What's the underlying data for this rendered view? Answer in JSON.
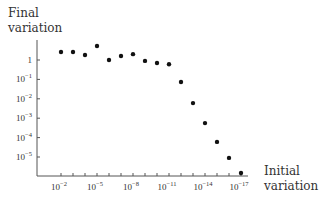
{
  "chart_data": {
    "type": "scatter",
    "title": "",
    "ylabel": "Final variation",
    "xlabel": "Initial variation",
    "y_scale": "log",
    "x_scale": "log",
    "x_reversed": true,
    "ylim": [
      1e-06,
      10
    ],
    "xlim": [
      0.1,
      1e-18
    ],
    "y_ticks": [
      {
        "exp": 0,
        "label": "1"
      },
      {
        "exp": -1,
        "label": "10",
        "sup": "−1"
      },
      {
        "exp": -2,
        "label": "10",
        "sup": "−2"
      },
      {
        "exp": -3,
        "label": "10",
        "sup": "−3"
      },
      {
        "exp": -4,
        "label": "10",
        "sup": "−4"
      },
      {
        "exp": -5,
        "label": "10",
        "sup": "−5"
      }
    ],
    "x_ticks": [
      {
        "exp": -2,
        "label": "10",
        "sup": "−2"
      },
      {
        "exp": -5,
        "label": "10",
        "sup": "−5"
      },
      {
        "exp": -8,
        "label": "10",
        "sup": "−8"
      },
      {
        "exp": -11,
        "label": "10",
        "sup": "−11"
      },
      {
        "exp": -14,
        "label": "10",
        "sup": "−14"
      },
      {
        "exp": -17,
        "label": "10",
        "sup": "−17"
      }
    ],
    "x_minor_tick_exps": [
      -2,
      -3,
      -4,
      -5,
      -6,
      -7,
      -8,
      -9,
      -10,
      -11,
      -12,
      -13,
      -14,
      -15,
      -16,
      -17
    ],
    "grid": false,
    "legend": null,
    "points": [
      {
        "x": 0.01,
        "y": 2.6
      },
      {
        "x": 0.001,
        "y": 2.6
      },
      {
        "x": 0.0001,
        "y": 1.8
      },
      {
        "x": 1e-05,
        "y": 5.3
      },
      {
        "x": 1e-06,
        "y": 1.0
      },
      {
        "x": 1e-07,
        "y": 1.6
      },
      {
        "x": 1e-08,
        "y": 2.0
      },
      {
        "x": 1e-09,
        "y": 0.9
      },
      {
        "x": 1e-10,
        "y": 0.7
      },
      {
        "x": 1e-11,
        "y": 0.6
      },
      {
        "x": 1e-12,
        "y": 0.074
      },
      {
        "x": 1e-13,
        "y": 0.006
      },
      {
        "x": 1e-14,
        "y": 0.00056
      },
      {
        "x": 1e-15,
        "y": 6e-05
      },
      {
        "x": 1e-16,
        "y": 9e-06
      },
      {
        "x": 1e-17,
        "y": 1.5e-06
      }
    ]
  },
  "labels": {
    "y_line1": "Final",
    "y_line2": "variation",
    "x_line1": "Initial",
    "x_line2": "variation"
  }
}
